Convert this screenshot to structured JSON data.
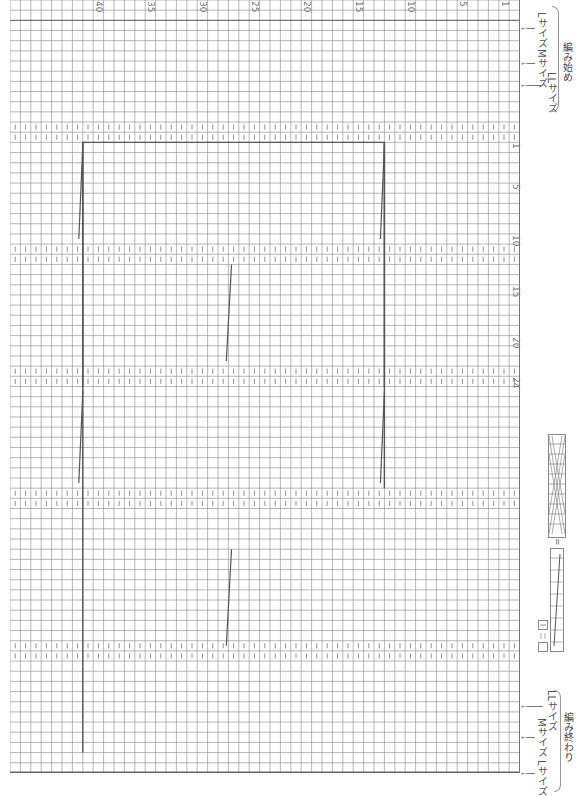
{
  "chart": {
    "type": "knitting-chart",
    "orientation": "rotated-90",
    "cell_width_px": 10.4,
    "cell_height_px": 10.1,
    "columns": 49,
    "rows": 76,
    "grid_line_color": "#888888",
    "major_line_color": "#555555",
    "rib_mark_color": "#666666"
  },
  "stitch_numbers": {
    "labels": [
      "40",
      "35",
      "30",
      "25",
      "20",
      "15",
      "10",
      "5",
      "1"
    ],
    "col_positions": [
      8,
      13,
      18,
      23,
      28,
      33,
      38,
      43,
      47
    ]
  },
  "row_numbers": {
    "labels": [
      "1",
      "5",
      "10",
      "15",
      "20",
      "24"
    ],
    "row_positions": [
      14,
      18,
      23,
      28,
      33,
      37
    ]
  },
  "rib_bands": [
    {
      "start_row": 12,
      "rows": 2
    },
    {
      "start_row": 24,
      "rows": 2
    },
    {
      "start_row": 36,
      "rows": 2
    },
    {
      "start_row": 48,
      "rows": 2
    },
    {
      "start_row": 51,
      "rows": 0
    },
    {
      "start_row": 63,
      "rows": 2
    }
  ],
  "start_labels": {
    "l_size": "Lサイズ",
    "m_size": "Mサイズ",
    "ll_size": "LLサイズ",
    "caption": "編み始め"
  },
  "end_labels": {
    "l_size": "Lサイズ",
    "m_size": "Mサイズ",
    "ll_size": "LLサイズ",
    "caption": "編み終わり"
  },
  "legend": {
    "equals_symbol": "="
  }
}
